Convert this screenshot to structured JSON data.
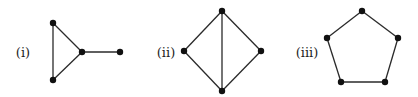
{
  "figure": {
    "graphs": [
      {
        "label": "(i)",
        "label_pos": [
          23,
          52
        ],
        "description": "triangle with pendant vertex",
        "vertices": [
          [
            53,
            23
          ],
          [
            53,
            80
          ],
          [
            82,
            52
          ],
          [
            120,
            52
          ]
        ],
        "edges": [
          [
            0,
            1
          ],
          [
            0,
            2
          ],
          [
            1,
            2
          ],
          [
            2,
            3
          ]
        ]
      },
      {
        "label": "(ii)",
        "label_pos": [
          166,
          52
        ],
        "description": "diamond (K4 minus one edge) with vertical diagonal",
        "vertices": [
          [
            222,
            11
          ],
          [
            184,
            51
          ],
          [
            261,
            51
          ],
          [
            222,
            91
          ]
        ],
        "edges": [
          [
            0,
            1
          ],
          [
            0,
            2
          ],
          [
            1,
            3
          ],
          [
            2,
            3
          ],
          [
            0,
            3
          ]
        ]
      },
      {
        "label": "(iii)",
        "label_pos": [
          307,
          52
        ],
        "description": "pentagon (cycle C5)",
        "vertices": [
          [
            362,
            11
          ],
          [
            327,
            38
          ],
          [
            341,
            82
          ],
          [
            385,
            82
          ],
          [
            398,
            38
          ]
        ],
        "edges": [
          [
            0,
            1
          ],
          [
            1,
            2
          ],
          [
            2,
            3
          ],
          [
            3,
            4
          ],
          [
            4,
            0
          ]
        ]
      }
    ],
    "node_radius": 3.2,
    "colors": {
      "edge": "#2a2a2a",
      "node": "#111111",
      "background": "#ffffff"
    }
  }
}
